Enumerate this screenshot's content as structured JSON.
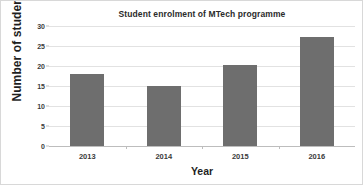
{
  "chart_data": {
    "type": "bar",
    "title": "Student enrolment of MTech programme",
    "xlabel": "Year",
    "ylabel": "Number of students",
    "categories": [
      "2013",
      "2014",
      "2015",
      "2016"
    ],
    "values": [
      18,
      15,
      20.3,
      27.3
    ],
    "ylim": [
      0,
      30
    ],
    "ytick_labels": [
      "0",
      "5",
      "10",
      "15",
      "20",
      "25",
      "30"
    ],
    "ytick_values": [
      0,
      5,
      10,
      15,
      20,
      25,
      30
    ],
    "grid": true,
    "legend": false,
    "series": [
      {
        "name": "Number of students",
        "values": [
          18,
          15,
          20.3,
          27.3
        ]
      }
    ],
    "colors": {
      "bar": "#6e6e6e",
      "gridline": "#e2e2e2",
      "axis": "#bdbdbd",
      "text": "#1f1f1f",
      "background": "#ffffff"
    }
  }
}
